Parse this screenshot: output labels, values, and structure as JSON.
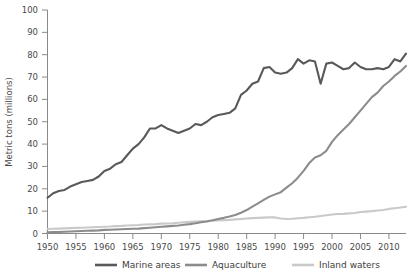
{
  "chart_data": {
    "type": "line",
    "title": "",
    "xlabel": "",
    "ylabel": "Metric tons (millions)",
    "xlim": [
      1950,
      2013
    ],
    "ylim": [
      0,
      100
    ],
    "yticks": [
      0,
      10,
      20,
      30,
      40,
      50,
      60,
      70,
      80,
      90,
      100
    ],
    "xticks": [
      1950,
      1955,
      1960,
      1965,
      1970,
      1975,
      1980,
      1985,
      1990,
      1995,
      2000,
      2005,
      2010
    ],
    "grid": false,
    "legend_position": "bottom",
    "x": [
      1950,
      1951,
      1952,
      1953,
      1954,
      1955,
      1956,
      1957,
      1958,
      1959,
      1960,
      1961,
      1962,
      1963,
      1964,
      1965,
      1966,
      1967,
      1968,
      1969,
      1970,
      1971,
      1972,
      1973,
      1974,
      1975,
      1976,
      1977,
      1978,
      1979,
      1980,
      1981,
      1982,
      1983,
      1984,
      1985,
      1986,
      1987,
      1988,
      1989,
      1990,
      1991,
      1992,
      1993,
      1994,
      1995,
      1996,
      1997,
      1998,
      1999,
      2000,
      2001,
      2002,
      2003,
      2004,
      2005,
      2006,
      2007,
      2008,
      2009,
      2010,
      2011,
      2012,
      2013
    ],
    "series": [
      {
        "name": "Marine areas",
        "color": "#595959",
        "values": [
          16,
          18,
          19,
          19.5,
          21,
          22,
          23,
          23.5,
          24,
          25.5,
          28,
          29,
          31,
          32,
          35,
          38,
          40,
          43,
          47,
          47,
          48.5,
          47,
          46,
          45,
          46,
          47,
          49,
          48.5,
          50,
          52,
          53,
          53.5,
          54,
          56,
          62,
          64,
          67,
          68,
          74,
          74.5,
          72,
          71.5,
          72,
          74,
          78,
          76,
          77.5,
          77,
          67,
          76,
          76.5,
          75,
          73.5,
          74,
          76.5,
          74.5,
          73.5,
          73.5,
          74,
          73.5,
          74.5,
          78,
          77,
          80.5
        ]
      },
      {
        "name": "Aquaculture",
        "color": "#8c8c8c",
        "values": [
          0.5,
          0.6,
          0.7,
          0.8,
          0.9,
          1,
          1.1,
          1.2,
          1.3,
          1.4,
          1.6,
          1.7,
          1.8,
          1.9,
          2,
          2.1,
          2.2,
          2.4,
          2.6,
          2.8,
          3,
          3.2,
          3.4,
          3.6,
          3.9,
          4.2,
          4.6,
          5,
          5.4,
          5.9,
          6.5,
          7,
          7.6,
          8.3,
          9.3,
          10.5,
          12,
          13.5,
          15,
          16.5,
          17.5,
          18.5,
          20.5,
          22.5,
          25,
          28,
          31.5,
          34,
          35,
          37,
          41,
          44,
          46.5,
          49,
          52,
          55,
          58,
          61,
          63,
          66,
          68,
          70.5,
          72.5,
          75
        ]
      },
      {
        "name": "Inland waters",
        "color": "#c9c9c9",
        "values": [
          2,
          2.1,
          2.2,
          2.3,
          2.4,
          2.5,
          2.6,
          2.7,
          2.8,
          2.9,
          3,
          3.1,
          3.3,
          3.4,
          3.6,
          3.7,
          3.8,
          4,
          4.1,
          4.2,
          4.4,
          4.5,
          4.6,
          4.8,
          5,
          5.2,
          5.4,
          5.5,
          5.6,
          5.7,
          5.8,
          6,
          6.1,
          6.3,
          6.5,
          6.7,
          6.9,
          7,
          7.1,
          7.2,
          7.2,
          6.7,
          6.5,
          6.6,
          6.8,
          7,
          7.3,
          7.5,
          7.8,
          8.2,
          8.5,
          8.7,
          8.8,
          9,
          9.2,
          9.6,
          9.8,
          10,
          10.3,
          10.5,
          11,
          11.3,
          11.6,
          12
        ]
      }
    ]
  },
  "axis": {
    "y_title": "Metric tons (millions)",
    "y_tick_labels": [
      "0",
      "10",
      "20",
      "30",
      "40",
      "50",
      "60",
      "70",
      "80",
      "90",
      "100"
    ],
    "x_tick_labels": [
      "1950",
      "1955",
      "1960",
      "1965",
      "1970",
      "1975",
      "1980",
      "1985",
      "1990",
      "1995",
      "2000",
      "2005",
      "2010"
    ]
  },
  "legend": {
    "items": [
      {
        "label": "Marine areas",
        "color": "#595959"
      },
      {
        "label": "Aquaculture",
        "color": "#8c8c8c"
      },
      {
        "label": "Inland waters",
        "color": "#c9c9c9"
      }
    ]
  }
}
